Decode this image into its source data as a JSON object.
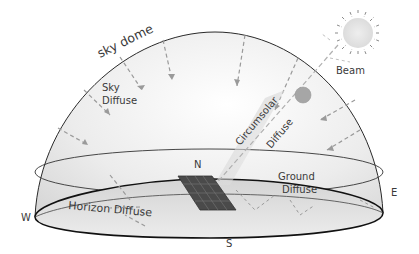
{
  "diagram": {
    "labels": {
      "sky_dome": "sky dome",
      "sky_diffuse_line1": "Sky",
      "sky_diffuse_line2": "Diffuse",
      "beam": "Beam",
      "circumsolar": "Circumsolar",
      "circumsolar_diffuse": "Diffuse",
      "ground_line1": "Ground",
      "ground_line2": "Diffuse",
      "horizon_diffuse": "Horizon Diffuse"
    },
    "compass": {
      "north": "N",
      "south": "S",
      "east": "E",
      "west": "W"
    },
    "colors": {
      "dome_outline": "#2a2a2a",
      "dome_fill": "#e8e8e8",
      "arrow": "#9a9a9a",
      "sun_fill": "#e6e6e6",
      "circumsolar_disc": "#a8a8a8",
      "panel": "#4a4a4a",
      "ground_fill": "#dcdcdc"
    }
  }
}
